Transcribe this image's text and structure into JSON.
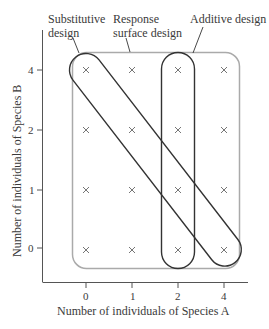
{
  "diagram": {
    "labels": {
      "substitutive_line1": "Substitutive",
      "substitutive_line2": "design",
      "response_line1": "Response",
      "response_line2": "surface design",
      "additive": "Additive design"
    },
    "x_axis": {
      "title": "Number of individuals of Species A",
      "ticks": [
        "0",
        "1",
        "2",
        "4"
      ]
    },
    "y_axis": {
      "title": "Number of individuals of Species B",
      "ticks": [
        "4",
        "2",
        "1",
        "0"
      ]
    },
    "grid_marker": "×",
    "designs": [
      {
        "name": "Substitutive design",
        "points": [
          [
            0,
            4
          ],
          [
            1,
            2
          ],
          [
            2,
            1
          ],
          [
            4,
            0
          ]
        ]
      },
      {
        "name": "Response surface design",
        "points": "all 16 combinations"
      },
      {
        "name": "Additive design",
        "points": [
          [
            2,
            4
          ],
          [
            2,
            2
          ],
          [
            2,
            1
          ],
          [
            2,
            0
          ]
        ]
      }
    ],
    "colors": {
      "axis": "#555555",
      "response_box": "#aaaaaa",
      "capsules": "#333333",
      "markers": "#666666"
    }
  }
}
